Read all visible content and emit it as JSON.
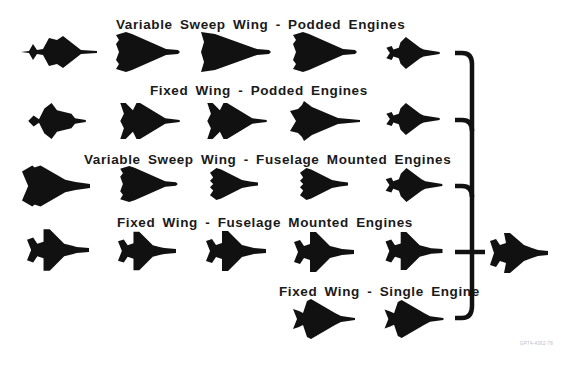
{
  "diagram": {
    "rows": [
      {
        "title": "Variable Sweep Wing - Podded Engines",
        "aircraft": [
          {
            "shape": "canard-delta",
            "x": 20,
            "y": 32
          },
          {
            "shape": "delta-blunt",
            "x": 115,
            "y": 32
          },
          {
            "shape": "delta-large",
            "x": 200,
            "y": 32
          },
          {
            "shape": "delta-blunt",
            "x": 292,
            "y": 32
          },
          {
            "shape": "twin-tail-compact",
            "x": 383,
            "y": 37
          }
        ]
      },
      {
        "title": "Fixed Wing - Podded Engines",
        "aircraft": [
          {
            "shape": "canard-fighter",
            "x": 25,
            "y": 103
          },
          {
            "shape": "double-delta",
            "x": 118,
            "y": 103
          },
          {
            "shape": "double-delta",
            "x": 205,
            "y": 103
          },
          {
            "shape": "cranked-arrow",
            "x": 290,
            "y": 103
          },
          {
            "shape": "twin-tail-compact",
            "x": 383,
            "y": 103
          }
        ]
      },
      {
        "title": "Variable Sweep Wing - Fuselage Mounted Engines",
        "aircraft": [
          {
            "shape": "swing-wing-swept",
            "x": 22,
            "y": 163
          },
          {
            "shape": "delta-blunt",
            "x": 118,
            "y": 165
          },
          {
            "shape": "notched-delta",
            "x": 203,
            "y": 165
          },
          {
            "shape": "notched-delta",
            "x": 293,
            "y": 165
          },
          {
            "shape": "twin-tail-compact",
            "x": 383,
            "y": 165
          }
        ]
      },
      {
        "title": "Fixed Wing - Fuselage Mounted Engines",
        "aircraft": [
          {
            "shape": "twin-fighter",
            "x": 27,
            "y": 228
          },
          {
            "shape": "twin-fighter",
            "x": 118,
            "y": 230
          },
          {
            "shape": "twin-fighter",
            "x": 205,
            "y": 230
          },
          {
            "shape": "twin-fighter",
            "x": 293,
            "y": 230
          },
          {
            "shape": "twin-fighter",
            "x": 383,
            "y": 230
          }
        ]
      },
      {
        "title": "Fixed Wing - Single Engine",
        "aircraft": [
          {
            "shape": "single-delta",
            "x": 293,
            "y": 296
          },
          {
            "shape": "single-delta",
            "x": 383,
            "y": 298
          }
        ]
      }
    ],
    "result_aircraft": {
      "shape": "final-fighter",
      "x": 490,
      "y": 230
    },
    "reference_code": "GP74-4362-78",
    "colors": {
      "silhouette": "#111111",
      "bracket": "#111111",
      "background": "#ffffff"
    }
  }
}
